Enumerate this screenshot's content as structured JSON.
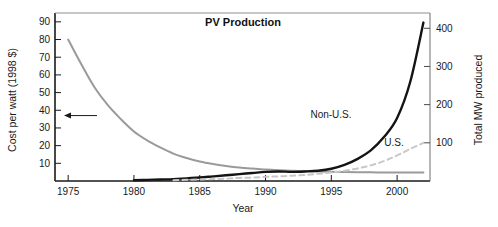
{
  "chart_data": {
    "type": "line",
    "title": "PV Production",
    "xlabel": "Year",
    "ylabel": "Cost per watt (1998 $)",
    "y2label": "Total MW produced",
    "xlim": [
      1974,
      2002.5
    ],
    "ylim": [
      0,
      95
    ],
    "y2lim": [
      0,
      440
    ],
    "grid": false,
    "legend": "inline-annotations",
    "xticks": [
      1975,
      1980,
      1985,
      1990,
      1995,
      2000
    ],
    "xtick_labels": [
      "1975",
      "1980",
      "1985",
      "1990",
      "1995",
      "2000"
    ],
    "yticks": [
      10,
      20,
      30,
      40,
      50,
      60,
      70,
      80,
      90
    ],
    "ytick_labels": [
      "10",
      "20",
      "30",
      "40",
      "50",
      "60",
      "70",
      "80",
      "90"
    ],
    "y2ticks": [
      100,
      200,
      300,
      400
    ],
    "y2tick_labels": [
      "100",
      "200",
      "300",
      "400"
    ],
    "annotations": [
      {
        "text": "",
        "name": "left-axis-arrow",
        "kind": "arrow",
        "points_to_axis": "left",
        "at_y_value": 37
      }
    ],
    "series": [
      {
        "name": "Cost per watt",
        "label": "",
        "axis": "left",
        "style": "solid",
        "color": "#9a9a9a",
        "width": 2,
        "x": [
          1975,
          1976,
          1977,
          1978,
          1979,
          1980,
          1981,
          1982,
          1983,
          1984,
          1985,
          1986,
          1987,
          1988,
          1989,
          1990,
          1991,
          1992,
          1993,
          1994,
          1995,
          1996,
          1997,
          1998,
          1999,
          2000,
          2001,
          2002
        ],
        "values": [
          80,
          66,
          53,
          43,
          35,
          28,
          23,
          19,
          15.5,
          13,
          11,
          9.6,
          8.5,
          7.6,
          7.0,
          6.5,
          6.1,
          5.8,
          5.6,
          5.4,
          5.2,
          5.1,
          5.0,
          4.9,
          4.85,
          4.8,
          4.8,
          4.8
        ]
      },
      {
        "name": "Non-U.S.",
        "label": "Non-U.S.",
        "axis": "right",
        "style": "solid",
        "color": "#141414",
        "width": 2.4,
        "x": [
          1980,
          1981,
          1982,
          1983,
          1984,
          1985,
          1986,
          1987,
          1988,
          1989,
          1990,
          1991,
          1992,
          1993,
          1994,
          1995,
          1996,
          1997,
          1998,
          1999,
          2000,
          2001,
          2002
        ],
        "values": [
          2,
          3,
          4,
          5,
          7,
          9,
          12,
          15,
          18,
          21,
          24,
          25,
          24,
          25,
          27,
          32,
          42,
          58,
          80,
          115,
          165,
          260,
          415
        ]
      },
      {
        "name": "U.S.",
        "label": "U.S.",
        "axis": "right",
        "style": "dashed",
        "color": "#c8c8c8",
        "width": 2,
        "x": [
          1983,
          1984,
          1985,
          1986,
          1987,
          1988,
          1989,
          1990,
          1991,
          1992,
          1993,
          1994,
          1995,
          1996,
          1997,
          1998,
          1999,
          2000,
          2001,
          2002
        ],
        "values": [
          2,
          3,
          4,
          5,
          6,
          8,
          9,
          11,
          12,
          14,
          16,
          19,
          22,
          27,
          33,
          41,
          52,
          67,
          84,
          100
        ]
      }
    ]
  },
  "axes": {
    "left_title": "Cost per watt (1998 $)",
    "right_title": "Total MW produced",
    "x_title": "Year"
  },
  "title": {
    "text": "PV Production"
  },
  "labels": {
    "non_us": "Non-U.S.",
    "us": "U.S."
  },
  "xtick": {
    "t0": "1975",
    "t1": "1980",
    "t2": "1985",
    "t3": "1990",
    "t4": "1995",
    "t5": "2000"
  },
  "ytick_left": {
    "t10": "10",
    "t20": "20",
    "t30": "30",
    "t40": "40",
    "t50": "50",
    "t60": "60",
    "t70": "70",
    "t80": "80",
    "t90": "90"
  },
  "ytick_right": {
    "t100": "100",
    "t200": "200",
    "t300": "300",
    "t400": "400"
  },
  "colors": {
    "cost_line": "#9a9a9a",
    "non_us_line": "#141414",
    "us_line": "#c8c8c8",
    "frame": "#1a1a1a",
    "text": "#1a1a1a",
    "background": "#ffffff"
  }
}
